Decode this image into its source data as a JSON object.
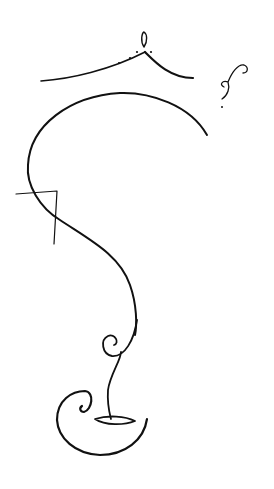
{
  "artwork": {
    "description": "Minimal black line-art drawing of an abstract figure with a crown-like arc, spiral flourishes and lips",
    "background": "#ffffff",
    "ink": "#111111"
  }
}
